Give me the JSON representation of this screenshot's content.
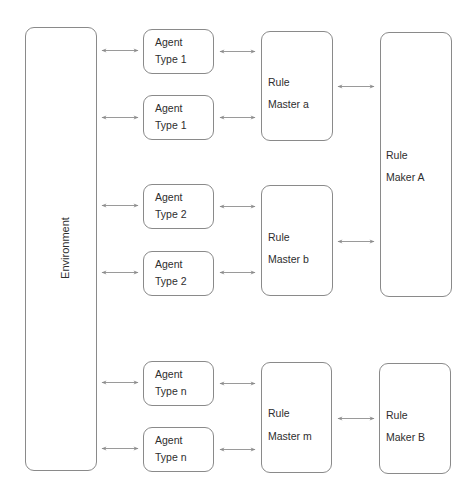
{
  "environment": {
    "label": "Environment",
    "box": {
      "x": 25,
      "y": 27,
      "w": 72,
      "h": 444
    }
  },
  "agents": [
    {
      "line1": "Agent",
      "line2": "Type 1",
      "box": {
        "x": 143,
        "y": 29,
        "w": 71,
        "h": 45
      }
    },
    {
      "line1": "Agent",
      "line2": "Type 1",
      "box": {
        "x": 143,
        "y": 95,
        "w": 71,
        "h": 45
      }
    },
    {
      "line1": "Agent",
      "line2": "Type 2",
      "box": {
        "x": 143,
        "y": 184,
        "w": 71,
        "h": 45
      }
    },
    {
      "line1": "Agent",
      "line2": "Type 2",
      "box": {
        "x": 143,
        "y": 251,
        "w": 71,
        "h": 45
      }
    },
    {
      "line1": "Agent",
      "line2": "Type n",
      "box": {
        "x": 143,
        "y": 361,
        "w": 71,
        "h": 45
      }
    },
    {
      "line1": "Agent",
      "line2": "Type n",
      "box": {
        "x": 143,
        "y": 427,
        "w": 71,
        "h": 45
      }
    }
  ],
  "rule_masters": [
    {
      "line1": "Rule",
      "line2": "Master a",
      "box": {
        "x": 261,
        "y": 31,
        "w": 72,
        "h": 110
      }
    },
    {
      "line1": "Rule",
      "line2": "Master b",
      "box": {
        "x": 261,
        "y": 185,
        "w": 72,
        "h": 111
      }
    },
    {
      "line1": "Rule",
      "line2": "Master m",
      "box": {
        "x": 261,
        "y": 362,
        "w": 71,
        "h": 111
      }
    }
  ],
  "rule_makers": [
    {
      "line1": "Rule",
      "line2": "Maker A",
      "box": {
        "x": 380,
        "y": 32,
        "w": 72,
        "h": 265
      }
    },
    {
      "line1": "Rule",
      "line2": "Maker B",
      "box": {
        "x": 379,
        "y": 363,
        "w": 72,
        "h": 111
      }
    }
  ],
  "arrows": [
    {
      "from": "Environment",
      "to": "Agent Type 1",
      "x1": 102,
      "x2": 138,
      "y": 50
    },
    {
      "from": "Environment",
      "to": "Agent Type 1",
      "x1": 102,
      "x2": 138,
      "y": 117
    },
    {
      "from": "Environment",
      "to": "Agent Type 2",
      "x1": 102,
      "x2": 138,
      "y": 205
    },
    {
      "from": "Environment",
      "to": "Agent Type 2",
      "x1": 102,
      "x2": 138,
      "y": 272
    },
    {
      "from": "Environment",
      "to": "Agent Type n",
      "x1": 102,
      "x2": 138,
      "y": 382
    },
    {
      "from": "Environment",
      "to": "Agent Type n",
      "x1": 102,
      "x2": 138,
      "y": 448
    },
    {
      "from": "Agent Type 1",
      "to": "Rule Master a",
      "x1": 220,
      "x2": 255,
      "y": 51
    },
    {
      "from": "Agent Type 1",
      "to": "Rule Master a",
      "x1": 220,
      "x2": 255,
      "y": 117
    },
    {
      "from": "Agent Type 2",
      "to": "Rule Master b",
      "x1": 220,
      "x2": 255,
      "y": 206
    },
    {
      "from": "Agent Type 2",
      "to": "Rule Master b",
      "x1": 220,
      "x2": 255,
      "y": 272
    },
    {
      "from": "Agent Type n",
      "to": "Rule Master m",
      "x1": 220,
      "x2": 255,
      "y": 383
    },
    {
      "from": "Agent Type n",
      "to": "Rule Master m",
      "x1": 220,
      "x2": 255,
      "y": 449
    },
    {
      "from": "Rule Master a",
      "to": "Rule Maker A",
      "x1": 338,
      "x2": 374,
      "y": 86
    },
    {
      "from": "Rule Master b",
      "to": "Rule Maker A",
      "x1": 338,
      "x2": 374,
      "y": 241
    },
    {
      "from": "Rule Master m",
      "to": "Rule Maker B",
      "x1": 338,
      "x2": 374,
      "y": 418
    }
  ],
  "colors": {
    "stroke": "#8a8a8a",
    "arrow": "#8c8c8c",
    "text": "#2e2e2e"
  }
}
